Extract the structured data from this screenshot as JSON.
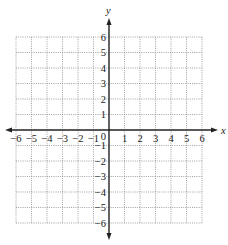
{
  "chart_data": {
    "type": "scatter",
    "title": "",
    "xlabel": "x",
    "ylabel": "y",
    "xlim": [
      -6,
      6
    ],
    "ylim": [
      -6,
      6
    ],
    "x_ticks": [
      -6,
      -5,
      -4,
      -3,
      -2,
      -1,
      1,
      2,
      3,
      4,
      5,
      6
    ],
    "y_ticks": [
      -6,
      -5,
      -4,
      -3,
      -2,
      -1,
      1,
      2,
      3,
      4,
      5,
      6
    ],
    "origin_label": "0",
    "grid": true,
    "grid_style": "dotted",
    "series": []
  },
  "colors": {
    "axis": "#222222",
    "grid": "#8a8a8a",
    "background": "#ffffff"
  },
  "layout": {
    "origin_px": [
      109,
      130
    ],
    "unit_px": 15.5,
    "x_arrow_left_px": 5,
    "x_arrow_right_px": 218,
    "y_arrow_top_px": 18,
    "y_arrow_bottom_px": 240
  }
}
